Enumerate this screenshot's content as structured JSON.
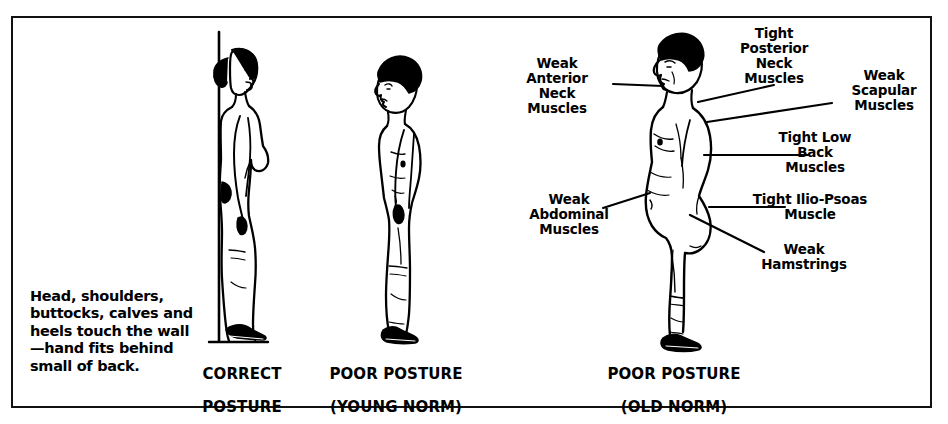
{
  "figure": {
    "title_alt": "Posture comparison diagram",
    "border_color": "#111111",
    "ink_color": "#000000",
    "background": "#ffffff"
  },
  "description": {
    "text": "Head, shoulders, buttocks, calves and heels touch the wall—hand fits behind small of back."
  },
  "captions": [
    {
      "id": "correct",
      "line1": "CORRECT",
      "line2": "POSTURE"
    },
    {
      "id": "poor-young",
      "line1": "POOR POSTURE",
      "line2": "(YOUNG NORM)"
    },
    {
      "id": "poor-old",
      "line1": "POOR POSTURE",
      "line2": "(OLD NORM)"
    }
  ],
  "annotations": [
    {
      "id": "weak-anterior-neck",
      "text": "Weak\nAnterior\nNeck\nMuscles"
    },
    {
      "id": "tight-posterior-neck",
      "text": "Tight\nPosterior\nNeck\nMuscles"
    },
    {
      "id": "weak-scapular",
      "text": "Weak\nScapular\nMuscles"
    },
    {
      "id": "tight-low-back",
      "text": "Tight Low\nBack\nMuscles"
    },
    {
      "id": "weak-abdominal",
      "text": "Weak\nAbdominal\nMuscles"
    },
    {
      "id": "tight-ilio-psoas",
      "text": "Tight Ilio-Psoas\nMuscle"
    },
    {
      "id": "weak-hamstrings",
      "text": "Weak\nHamstrings"
    }
  ],
  "figures": [
    {
      "id": "figure-correct-posture",
      "label": "woman standing upright against wall line"
    },
    {
      "id": "figure-poor-posture-young",
      "label": "man standing with slouched posture"
    },
    {
      "id": "figure-poor-posture-old",
      "label": "man standing with exaggerated forward head and lordosis"
    }
  ]
}
